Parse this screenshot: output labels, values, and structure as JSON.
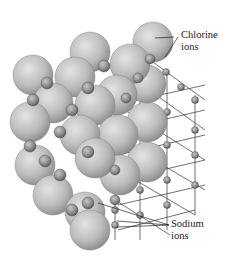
{
  "diagram": {
    "labels": {
      "chlorine": [
        "Chlorine",
        "ions"
      ],
      "sodium": [
        "Sodium",
        "ions"
      ]
    },
    "colors": {
      "large_sphere": "#bdbdbd",
      "small_sphere": "#8f8f8f",
      "lattice_line": "#333333",
      "text": "#222222"
    }
  }
}
